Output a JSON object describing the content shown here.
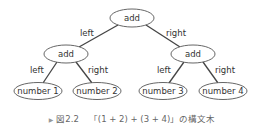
{
  "diagram": {
    "type": "syntax-tree",
    "nodes": [
      {
        "id": "root",
        "label": "add",
        "cx": 132,
        "cy": 18,
        "rx": 22,
        "ry": 9
      },
      {
        "id": "left",
        "label": "add",
        "cx": 66,
        "cy": 54,
        "rx": 22,
        "ry": 9
      },
      {
        "id": "right",
        "label": "add",
        "cx": 193,
        "cy": 54,
        "rx": 22,
        "ry": 9
      },
      {
        "id": "n1",
        "label": "number 1",
        "cx": 38,
        "cy": 91,
        "rx": 24,
        "ry": 8.5
      },
      {
        "id": "n2",
        "label": "number 2",
        "cx": 97,
        "cy": 91,
        "rx": 24,
        "ry": 8.5
      },
      {
        "id": "n3",
        "label": "number 3",
        "cx": 163,
        "cy": 91,
        "rx": 24,
        "ry": 8.5
      },
      {
        "id": "n4",
        "label": "number 4",
        "cx": 223,
        "cy": 91,
        "rx": 24,
        "ry": 8.5
      }
    ],
    "edges": [
      {
        "from": "root",
        "to": "left",
        "label": "left"
      },
      {
        "from": "root",
        "to": "right",
        "label": "right"
      },
      {
        "from": "left",
        "to": "n1",
        "label": "left"
      },
      {
        "from": "left",
        "to": "n2",
        "label": "right"
      },
      {
        "from": "right",
        "to": "n3",
        "label": "left"
      },
      {
        "from": "right",
        "to": "n4",
        "label": "right"
      }
    ]
  },
  "caption": {
    "marker": "▶",
    "figure_number": "図2.2",
    "text": "「(1 + 2) + (3 + 4)」の構文木"
  }
}
